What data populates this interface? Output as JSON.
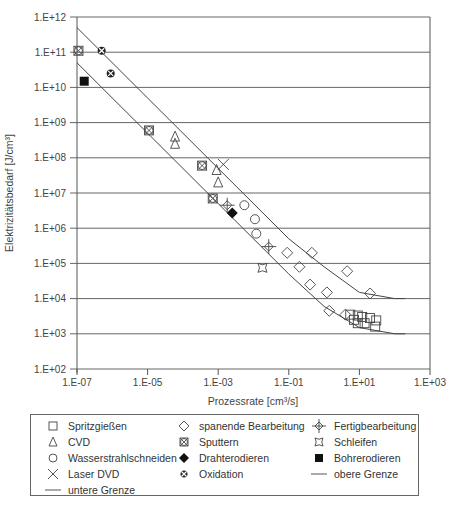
{
  "chart_data": {
    "type": "scatter",
    "title": "",
    "xlabel": "Prozessrate [cm³/s]",
    "ylabel": "Elektrizitätsbedarf [J/cm³]",
    "xscale": "log",
    "yscale": "log",
    "xlim": [
      1e-07,
      1000.0
    ],
    "ylim": [
      100.0,
      1000000000000.0
    ],
    "grid": "horizontal",
    "legend_position": "bottom",
    "x_ticks": [
      "1.E-07",
      "1.E-05",
      "1.E-03",
      "1.E-01",
      "1.E+01",
      "1.E+03"
    ],
    "y_ticks": [
      "1.E+12",
      "1.E+11",
      "1.E+10",
      "1.E+09",
      "1.E+08",
      "1.E+07",
      "1.E+06",
      "1.E+05",
      "1.E+04",
      "1.E+03",
      "1.E+02"
    ],
    "series": [
      {
        "name": "Spritzgießen",
        "marker": "square-open",
        "points": [
          [
            5.5,
            3500
          ],
          [
            7,
            2500
          ],
          [
            9,
            3300
          ],
          [
            9,
            2000
          ],
          [
            12,
            3000
          ],
          [
            14,
            2000
          ],
          [
            20,
            2800
          ],
          [
            30,
            2400
          ],
          [
            28,
            1600
          ]
        ]
      },
      {
        "name": "CVD",
        "marker": "triangle-open",
        "points": [
          [
            6e-05,
            400000000.0
          ],
          [
            6e-05,
            250000000.0
          ],
          [
            0.0009,
            45000000.0
          ],
          [
            0.001,
            20000000.0
          ]
        ]
      },
      {
        "name": "Wasserstrahlschneiden",
        "marker": "circle-open",
        "points": [
          [
            0.0055,
            4500000.0
          ],
          [
            0.011,
            1800000.0
          ],
          [
            0.012,
            700000.0
          ]
        ]
      },
      {
        "name": "Laser DVD",
        "marker": "x",
        "points": [
          [
            0.0014,
            65000000.0
          ]
        ]
      },
      {
        "name": "spanende Bearbeitung",
        "marker": "diamond-open",
        "points": [
          [
            0.09,
            200000.0
          ],
          [
            0.2,
            80000.0
          ],
          [
            0.45,
            200000.0
          ],
          [
            0.4,
            25000.0
          ],
          [
            1.2,
            15000.0
          ],
          [
            1.4,
            4500.0
          ],
          [
            4.5,
            60000.0
          ],
          [
            20,
            14000.0
          ],
          [
            4,
            3500.0
          ]
        ]
      },
      {
        "name": "Sputtern",
        "marker": "square-cross",
        "points": [
          [
            1.1e-07,
            110000000000.0
          ],
          [
            1.1e-05,
            600000000.0
          ],
          [
            0.00035,
            60000000.0
          ],
          [
            0.0007,
            7000000.0
          ]
        ]
      },
      {
        "name": "Drahterodieren",
        "marker": "diamond-filled",
        "points": [
          [
            0.0025,
            2700000.0
          ]
        ]
      },
      {
        "name": "Oxidation",
        "marker": "circle-cross-filled",
        "points": [
          [
            5e-07,
            110000000000.0
          ],
          [
            9e-07,
            25000000000.0
          ]
        ]
      },
      {
        "name": "Fertigbearbeitung",
        "marker": "diamond-crosshair",
        "points": [
          [
            0.0018,
            4500000.0
          ],
          [
            0.027,
            300000.0
          ]
        ]
      },
      {
        "name": "Schleifen",
        "marker": "star-open",
        "points": [
          [
            0.018,
            75000.0
          ]
        ]
      },
      {
        "name": "Bohrerodieren",
        "marker": "square-filled",
        "points": [
          [
            1.6e-07,
            15000000000.0
          ]
        ]
      },
      {
        "name": "untere Grenze",
        "marker": "line",
        "points": [
          [
            1e-07,
            50000000000.0
          ],
          [
            1e-05,
            500000000.0
          ],
          [
            0.001,
            5000000.0
          ],
          [
            0.1,
            50000.0
          ],
          [
            1,
            6000.0
          ],
          [
            10,
            1500.0
          ],
          [
            100,
            1000.0
          ],
          [
            200,
            1000.0
          ]
        ]
      },
      {
        "name": "obere Grenze",
        "marker": "line",
        "points": [
          [
            1e-07,
            500000000000.0
          ],
          [
            1e-05,
            5000000000.0
          ],
          [
            0.001,
            50000000.0
          ],
          [
            0.1,
            500000.0
          ],
          [
            1,
            80000.0
          ],
          [
            10,
            15000.0
          ],
          [
            100,
            10000.0
          ],
          [
            200,
            10000.0
          ]
        ]
      }
    ]
  },
  "legend": {
    "items": [
      {
        "label": "Spritzgießen",
        "icon": "square-open-icon"
      },
      {
        "label": "spanende Bearbeitung",
        "icon": "diamond-open-icon"
      },
      {
        "label": "Fertigbearbeitung",
        "icon": "crosshair-diamond-icon"
      },
      {
        "label": "CVD",
        "icon": "triangle-open-icon"
      },
      {
        "label": "Sputtern",
        "icon": "square-cross-icon"
      },
      {
        "label": "Schleifen",
        "icon": "star-open-icon"
      },
      {
        "label": "Wasserstrahlschneiden",
        "icon": "circle-open-icon"
      },
      {
        "label": "Drahterodieren",
        "icon": "diamond-filled-icon"
      },
      {
        "label": "Bohrerodieren",
        "icon": "square-filled-icon"
      },
      {
        "label": "Laser DVD",
        "icon": "x-icon"
      },
      {
        "label": "Oxidation",
        "icon": "circle-cross-filled-icon"
      },
      {
        "label": "obere Grenze",
        "icon": "line-icon"
      },
      {
        "label": "untere Grenze",
        "icon": "line-icon"
      }
    ]
  }
}
